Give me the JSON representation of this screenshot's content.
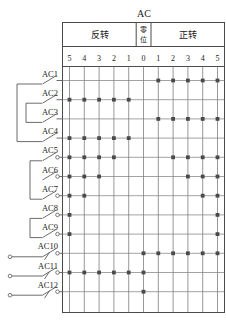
{
  "diagram": {
    "title": "AC",
    "sections": [
      {
        "id": "reverse",
        "label": "反转",
        "cols": [
          "5",
          "4",
          "3",
          "2",
          "1"
        ]
      },
      {
        "id": "zero",
        "label": "零位",
        "cols": [
          "0"
        ]
      },
      {
        "id": "forward",
        "label": "正转",
        "cols": [
          "1",
          "2",
          "3",
          "4",
          "5"
        ]
      }
    ],
    "column_numbers": [
      "5",
      "4",
      "3",
      "2",
      "1",
      "0",
      "1",
      "2",
      "3",
      "4",
      "5"
    ],
    "rows": [
      {
        "label": "AC1",
        "dots": [
          6,
          7,
          8,
          9,
          10
        ]
      },
      {
        "label": "AC2",
        "dots": [
          0,
          1,
          2,
          3,
          4
        ]
      },
      {
        "label": "AC3",
        "dots": [
          6,
          7,
          8,
          9,
          10
        ]
      },
      {
        "label": "AC4",
        "dots": [
          0,
          1,
          2,
          3,
          4
        ]
      },
      {
        "label": "AC5",
        "dots": [
          0,
          1,
          2,
          3,
          7,
          8,
          9,
          10
        ]
      },
      {
        "label": "AC6",
        "dots": [
          0,
          1,
          2,
          8,
          9,
          10
        ]
      },
      {
        "label": "AC7",
        "dots": [
          0,
          1,
          9,
          10
        ]
      },
      {
        "label": "AC8",
        "dots": [
          0,
          10
        ]
      },
      {
        "label": "AC9",
        "dots": [
          0,
          10
        ]
      },
      {
        "label": "AC10",
        "dots": [
          5,
          6,
          7,
          8,
          9,
          10
        ]
      },
      {
        "label": "AC11",
        "dots": [
          0,
          1,
          2,
          3,
          4,
          5
        ]
      },
      {
        "label": "AC12",
        "dots": [
          5
        ]
      }
    ]
  }
}
